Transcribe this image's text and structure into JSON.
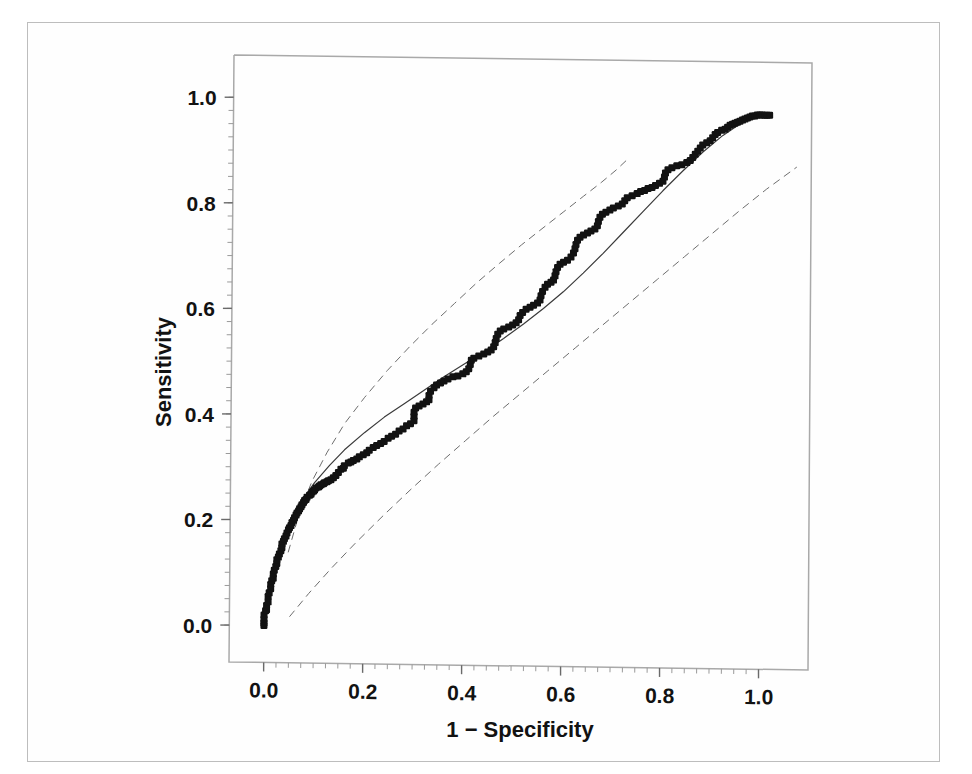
{
  "figure": {
    "background_color": "#fefefe",
    "border_color": "#bdbdbd",
    "ink_color": "#121212",
    "curve_color": "#3a3a3a",
    "band_color": "#6e6e6e"
  },
  "chart_data": {
    "type": "scatter",
    "title": "",
    "subtitle": "",
    "xlabel": "1 − Specificity",
    "ylabel": "Sensitivity",
    "xlim": [
      -0.07,
      1.1
    ],
    "ylim": [
      -0.07,
      1.08
    ],
    "grid": false,
    "legend": null,
    "legend_position": "none",
    "xticks": [
      0.0,
      0.2,
      0.4,
      0.6,
      0.8,
      1.0
    ],
    "xtick_labels": [
      "0.0",
      "0.2",
      "0.4",
      "0.6",
      "0.8",
      "1.0"
    ],
    "yticks": [
      0.0,
      0.2,
      0.4,
      0.6,
      0.8,
      1.0
    ],
    "ytick_labels": [
      "0.0",
      "0.2",
      "0.4",
      "0.6",
      "0.8",
      "1.0"
    ],
    "minor_tick_interval": 0.025,
    "annotations": [],
    "series": [
      {
        "name": "Empirical ROC points",
        "type": "scatter",
        "marker": "filled-square",
        "marker_size": 7,
        "color": "#121212",
        "points": [
          [
            0.0,
            0.0
          ],
          [
            0.0,
            0.005
          ],
          [
            0.0,
            0.012
          ],
          [
            0.0,
            0.02
          ],
          [
            0.003,
            0.028
          ],
          [
            0.005,
            0.03
          ],
          [
            0.005,
            0.038
          ],
          [
            0.008,
            0.045
          ],
          [
            0.008,
            0.055
          ],
          [
            0.01,
            0.062
          ],
          [
            0.013,
            0.07
          ],
          [
            0.013,
            0.078
          ],
          [
            0.015,
            0.085
          ],
          [
            0.018,
            0.09
          ],
          [
            0.018,
            0.098
          ],
          [
            0.02,
            0.105
          ],
          [
            0.023,
            0.112
          ],
          [
            0.025,
            0.118
          ],
          [
            0.025,
            0.125
          ],
          [
            0.028,
            0.13
          ],
          [
            0.03,
            0.136
          ],
          [
            0.033,
            0.142
          ],
          [
            0.035,
            0.148
          ],
          [
            0.035,
            0.155
          ],
          [
            0.038,
            0.16
          ],
          [
            0.04,
            0.165
          ],
          [
            0.043,
            0.17
          ],
          [
            0.045,
            0.176
          ],
          [
            0.048,
            0.182
          ],
          [
            0.05,
            0.186
          ],
          [
            0.053,
            0.19
          ],
          [
            0.055,
            0.196
          ],
          [
            0.058,
            0.2
          ],
          [
            0.06,
            0.205
          ],
          [
            0.063,
            0.21
          ],
          [
            0.065,
            0.214
          ],
          [
            0.068,
            0.218
          ],
          [
            0.07,
            0.222
          ],
          [
            0.073,
            0.226
          ],
          [
            0.075,
            0.23
          ],
          [
            0.078,
            0.234
          ],
          [
            0.08,
            0.238
          ],
          [
            0.083,
            0.24
          ],
          [
            0.085,
            0.244
          ],
          [
            0.09,
            0.248
          ],
          [
            0.093,
            0.25
          ],
          [
            0.095,
            0.254
          ],
          [
            0.098,
            0.256
          ],
          [
            0.1,
            0.258
          ],
          [
            0.103,
            0.262
          ],
          [
            0.108,
            0.264
          ],
          [
            0.11,
            0.266
          ],
          [
            0.113,
            0.268
          ],
          [
            0.118,
            0.27
          ],
          [
            0.12,
            0.272
          ],
          [
            0.125,
            0.274
          ],
          [
            0.128,
            0.276
          ],
          [
            0.133,
            0.278
          ],
          [
            0.138,
            0.282
          ],
          [
            0.143,
            0.286
          ],
          [
            0.148,
            0.292
          ],
          [
            0.153,
            0.298
          ],
          [
            0.158,
            0.3
          ],
          [
            0.16,
            0.305
          ],
          [
            0.168,
            0.31
          ],
          [
            0.173,
            0.312
          ],
          [
            0.178,
            0.315
          ],
          [
            0.185,
            0.318
          ],
          [
            0.19,
            0.322
          ],
          [
            0.198,
            0.326
          ],
          [
            0.205,
            0.33
          ],
          [
            0.21,
            0.335
          ],
          [
            0.218,
            0.34
          ],
          [
            0.225,
            0.344
          ],
          [
            0.233,
            0.348
          ],
          [
            0.24,
            0.352
          ],
          [
            0.248,
            0.358
          ],
          [
            0.255,
            0.362
          ],
          [
            0.263,
            0.366
          ],
          [
            0.27,
            0.372
          ],
          [
            0.278,
            0.376
          ],
          [
            0.285,
            0.382
          ],
          [
            0.293,
            0.386
          ],
          [
            0.3,
            0.392
          ],
          [
            0.3,
            0.4
          ],
          [
            0.3,
            0.408
          ],
          [
            0.303,
            0.416
          ],
          [
            0.31,
            0.42
          ],
          [
            0.318,
            0.424
          ],
          [
            0.325,
            0.428
          ],
          [
            0.33,
            0.432
          ],
          [
            0.33,
            0.44
          ],
          [
            0.333,
            0.448
          ],
          [
            0.34,
            0.455
          ],
          [
            0.345,
            0.46
          ],
          [
            0.353,
            0.464
          ],
          [
            0.36,
            0.468
          ],
          [
            0.368,
            0.472
          ],
          [
            0.378,
            0.476
          ],
          [
            0.388,
            0.478
          ],
          [
            0.398,
            0.482
          ],
          [
            0.405,
            0.486
          ],
          [
            0.41,
            0.492
          ],
          [
            0.413,
            0.5
          ],
          [
            0.415,
            0.508
          ],
          [
            0.42,
            0.512
          ],
          [
            0.43,
            0.516
          ],
          [
            0.44,
            0.52
          ],
          [
            0.448,
            0.524
          ],
          [
            0.455,
            0.528
          ],
          [
            0.46,
            0.534
          ],
          [
            0.463,
            0.542
          ],
          [
            0.465,
            0.55
          ],
          [
            0.468,
            0.558
          ],
          [
            0.473,
            0.564
          ],
          [
            0.48,
            0.568
          ],
          [
            0.49,
            0.572
          ],
          [
            0.498,
            0.576
          ],
          [
            0.505,
            0.58
          ],
          [
            0.51,
            0.586
          ],
          [
            0.513,
            0.594
          ],
          [
            0.518,
            0.6
          ],
          [
            0.525,
            0.606
          ],
          [
            0.533,
            0.61
          ],
          [
            0.54,
            0.614
          ],
          [
            0.548,
            0.618
          ],
          [
            0.553,
            0.624
          ],
          [
            0.555,
            0.632
          ],
          [
            0.558,
            0.64
          ],
          [
            0.563,
            0.648
          ],
          [
            0.568,
            0.654
          ],
          [
            0.575,
            0.658
          ],
          [
            0.58,
            0.662
          ],
          [
            0.583,
            0.67
          ],
          [
            0.585,
            0.678
          ],
          [
            0.588,
            0.686
          ],
          [
            0.593,
            0.692
          ],
          [
            0.6,
            0.696
          ],
          [
            0.608,
            0.7
          ],
          [
            0.615,
            0.706
          ],
          [
            0.62,
            0.714
          ],
          [
            0.623,
            0.722
          ],
          [
            0.625,
            0.73
          ],
          [
            0.628,
            0.738
          ],
          [
            0.633,
            0.744
          ],
          [
            0.64,
            0.748
          ],
          [
            0.648,
            0.752
          ],
          [
            0.655,
            0.756
          ],
          [
            0.663,
            0.76
          ],
          [
            0.668,
            0.766
          ],
          [
            0.67,
            0.774
          ],
          [
            0.673,
            0.782
          ],
          [
            0.678,
            0.788
          ],
          [
            0.685,
            0.792
          ],
          [
            0.693,
            0.796
          ],
          [
            0.7,
            0.8
          ],
          [
            0.71,
            0.804
          ],
          [
            0.718,
            0.808
          ],
          [
            0.723,
            0.814
          ],
          [
            0.728,
            0.82
          ],
          [
            0.738,
            0.824
          ],
          [
            0.748,
            0.828
          ],
          [
            0.755,
            0.832
          ],
          [
            0.763,
            0.834
          ],
          [
            0.77,
            0.838
          ],
          [
            0.778,
            0.84
          ],
          [
            0.785,
            0.844
          ],
          [
            0.793,
            0.848
          ],
          [
            0.8,
            0.852
          ],
          [
            0.803,
            0.86
          ],
          [
            0.805,
            0.868
          ],
          [
            0.81,
            0.874
          ],
          [
            0.818,
            0.878
          ],
          [
            0.828,
            0.882
          ],
          [
            0.838,
            0.884
          ],
          [
            0.848,
            0.888
          ],
          [
            0.855,
            0.892
          ],
          [
            0.86,
            0.898
          ],
          [
            0.865,
            0.904
          ],
          [
            0.87,
            0.91
          ],
          [
            0.875,
            0.916
          ],
          [
            0.88,
            0.922
          ],
          [
            0.888,
            0.926
          ],
          [
            0.895,
            0.93
          ],
          [
            0.9,
            0.936
          ],
          [
            0.905,
            0.942
          ],
          [
            0.91,
            0.946
          ],
          [
            0.918,
            0.95
          ],
          [
            0.925,
            0.952
          ],
          [
            0.93,
            0.956
          ],
          [
            0.935,
            0.96
          ],
          [
            0.94,
            0.962
          ],
          [
            0.945,
            0.964
          ],
          [
            0.95,
            0.966
          ],
          [
            0.955,
            0.968
          ],
          [
            0.96,
            0.97
          ],
          [
            0.965,
            0.972
          ],
          [
            0.97,
            0.974
          ],
          [
            0.975,
            0.976
          ],
          [
            0.98,
            0.978
          ],
          [
            0.985,
            0.978
          ],
          [
            0.99,
            0.98
          ],
          [
            0.995,
            0.98
          ],
          [
            1.0,
            0.98
          ],
          [
            1.005,
            0.98
          ],
          [
            1.01,
            0.98
          ],
          [
            1.015,
            0.98
          ]
        ]
      },
      {
        "name": "Fitted ROC curve",
        "type": "line",
        "style": "solid",
        "color": "#3a3a3a",
        "width": 1.2,
        "binormal_a": 0.92,
        "binormal_b": 0.88,
        "points": [
          [
            0.0,
            0.0
          ],
          [
            0.02,
            0.105
          ],
          [
            0.04,
            0.165
          ],
          [
            0.06,
            0.21
          ],
          [
            0.08,
            0.245
          ],
          [
            0.1,
            0.272
          ],
          [
            0.13,
            0.305
          ],
          [
            0.16,
            0.335
          ],
          [
            0.2,
            0.368
          ],
          [
            0.24,
            0.398
          ],
          [
            0.28,
            0.424
          ],
          [
            0.32,
            0.45
          ],
          [
            0.36,
            0.476
          ],
          [
            0.4,
            0.5
          ],
          [
            0.44,
            0.524
          ],
          [
            0.48,
            0.55
          ],
          [
            0.52,
            0.578
          ],
          [
            0.56,
            0.608
          ],
          [
            0.6,
            0.64
          ],
          [
            0.64,
            0.676
          ],
          [
            0.68,
            0.714
          ],
          [
            0.72,
            0.754
          ],
          [
            0.76,
            0.794
          ],
          [
            0.8,
            0.834
          ],
          [
            0.84,
            0.872
          ],
          [
            0.88,
            0.908
          ],
          [
            0.92,
            0.94
          ],
          [
            0.96,
            0.966
          ],
          [
            1.0,
            0.982
          ],
          [
            1.02,
            0.984
          ]
        ]
      },
      {
        "name": "Upper confidence band",
        "type": "line",
        "style": "dashed",
        "color": "#6e6e6e",
        "width": 1.0,
        "points": [
          [
            0.048,
            0.14
          ],
          [
            0.07,
            0.215
          ],
          [
            0.095,
            0.275
          ],
          [
            0.125,
            0.33
          ],
          [
            0.16,
            0.385
          ],
          [
            0.2,
            0.435
          ],
          [
            0.245,
            0.486
          ],
          [
            0.29,
            0.532
          ],
          [
            0.335,
            0.575
          ],
          [
            0.38,
            0.615
          ],
          [
            0.425,
            0.655
          ],
          [
            0.47,
            0.692
          ],
          [
            0.515,
            0.728
          ],
          [
            0.56,
            0.762
          ],
          [
            0.6,
            0.792
          ],
          [
            0.64,
            0.822
          ],
          [
            0.675,
            0.848
          ],
          [
            0.705,
            0.872
          ],
          [
            0.725,
            0.89
          ]
        ]
      },
      {
        "name": "Lower confidence band",
        "type": "line",
        "style": "dashed",
        "color": "#6e6e6e",
        "width": 1.0,
        "points": [
          [
            0.052,
            0.018
          ],
          [
            0.09,
            0.062
          ],
          [
            0.135,
            0.11
          ],
          [
            0.185,
            0.16
          ],
          [
            0.24,
            0.212
          ],
          [
            0.295,
            0.262
          ],
          [
            0.35,
            0.31
          ],
          [
            0.405,
            0.356
          ],
          [
            0.46,
            0.402
          ],
          [
            0.515,
            0.446
          ],
          [
            0.57,
            0.49
          ],
          [
            0.625,
            0.534
          ],
          [
            0.68,
            0.578
          ],
          [
            0.735,
            0.622
          ],
          [
            0.79,
            0.666
          ],
          [
            0.845,
            0.71
          ],
          [
            0.9,
            0.754
          ],
          [
            0.955,
            0.798
          ],
          [
            1.01,
            0.84
          ],
          [
            1.07,
            0.882
          ]
        ]
      }
    ]
  }
}
